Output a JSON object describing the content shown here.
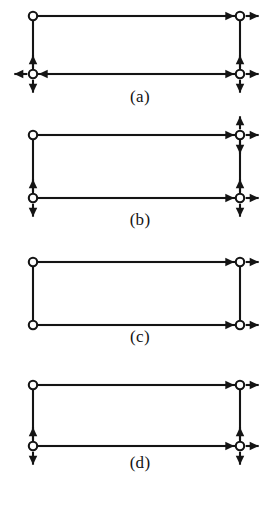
{
  "figure": {
    "background_color": "#ffffff",
    "ink_color": "#141414",
    "node_fill_color": "#ffffff",
    "caption_font_size_px": 17,
    "panels": [
      {
        "id": "a",
        "caption": "(a)",
        "rect": {
          "x1": 33,
          "y1": 16,
          "x2": 240,
          "y2": 74
        },
        "nodes": [
          {
            "name": "top-left",
            "x": 33,
            "y": 16,
            "arrows": []
          },
          {
            "name": "top-right",
            "x": 240,
            "y": 16,
            "arrows": [
              "left",
              "right"
            ]
          },
          {
            "name": "bottom-left",
            "x": 33,
            "y": 74,
            "arrows": [
              "up",
              "down",
              "left",
              "right"
            ]
          },
          {
            "name": "bottom-right",
            "x": 240,
            "y": 74,
            "arrows": [
              "up",
              "down",
              "left",
              "right"
            ]
          }
        ]
      },
      {
        "id": "b",
        "caption": "(b)",
        "rect": {
          "x1": 33,
          "y1": 17,
          "x2": 240,
          "y2": 80
        },
        "nodes": [
          {
            "name": "top-left",
            "x": 33,
            "y": 17,
            "arrows": []
          },
          {
            "name": "top-right",
            "x": 240,
            "y": 17,
            "arrows": [
              "up",
              "down",
              "left",
              "right"
            ]
          },
          {
            "name": "bottom-left",
            "x": 33,
            "y": 80,
            "arrows": [
              "up",
              "down"
            ]
          },
          {
            "name": "bottom-right",
            "x": 240,
            "y": 80,
            "arrows": [
              "up",
              "down",
              "left",
              "right"
            ]
          }
        ]
      },
      {
        "id": "c",
        "caption": "(c)",
        "rect": {
          "x1": 33,
          "y1": 22,
          "x2": 240,
          "y2": 85
        },
        "nodes": [
          {
            "name": "top-left",
            "x": 33,
            "y": 22,
            "arrows": []
          },
          {
            "name": "top-right",
            "x": 240,
            "y": 22,
            "arrows": [
              "left",
              "right"
            ]
          },
          {
            "name": "bottom-left",
            "x": 33,
            "y": 85,
            "arrows": []
          },
          {
            "name": "bottom-right",
            "x": 240,
            "y": 85,
            "arrows": [
              "left",
              "right"
            ]
          }
        ]
      },
      {
        "id": "d",
        "caption": "(d)",
        "rect": {
          "x1": 33,
          "y1": 27,
          "x2": 240,
          "y2": 88
        },
        "nodes": [
          {
            "name": "top-left",
            "x": 33,
            "y": 27,
            "arrows": []
          },
          {
            "name": "top-right",
            "x": 240,
            "y": 27,
            "arrows": [
              "left",
              "right"
            ]
          },
          {
            "name": "bottom-left",
            "x": 33,
            "y": 88,
            "arrows": [
              "up",
              "down"
            ]
          },
          {
            "name": "bottom-right",
            "x": 240,
            "y": 88,
            "arrows": [
              "up",
              "down",
              "left",
              "right"
            ]
          }
        ]
      }
    ]
  }
}
